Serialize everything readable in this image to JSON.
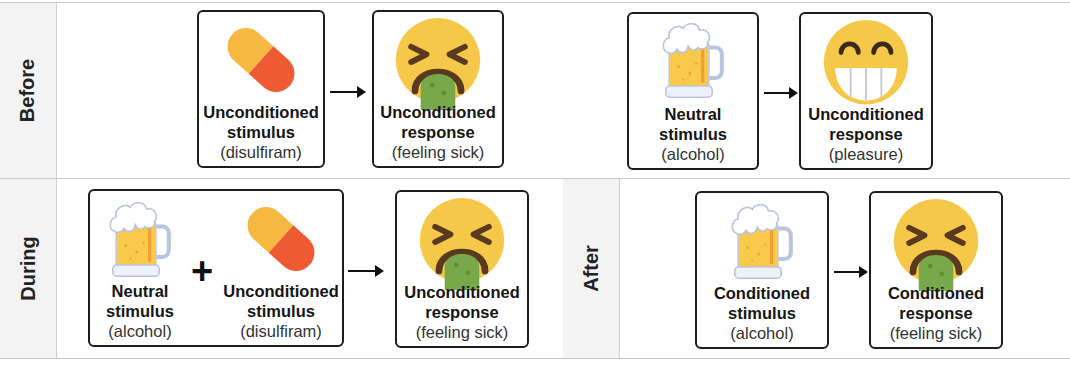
{
  "rows": {
    "before": {
      "label": "Before"
    },
    "during": {
      "label": "During"
    },
    "after": {
      "label": "After"
    }
  },
  "before_left": {
    "stimulus": {
      "icon": "pill-icon",
      "line1": "Unconditioned",
      "line2": "stimulus",
      "line3": "(disulfiram)"
    },
    "response": {
      "icon": "vomiting-face-icon",
      "line1": "Unconditioned",
      "line2": "response",
      "line3": "(feeling sick)"
    }
  },
  "before_right": {
    "stimulus": {
      "icon": "beer-mug-icon",
      "line1": "Neutral",
      "line2": "stimulus",
      "line3": "(alcohol)"
    },
    "response": {
      "icon": "grinning-face-icon",
      "line1": "Unconditioned",
      "line2": "response",
      "line3": "(pleasure)"
    }
  },
  "during": {
    "stimulus_a": {
      "icon": "beer-mug-icon",
      "line1": "Neutral",
      "line2": "stimulus",
      "line3": "(alcohol)"
    },
    "plus": "+",
    "stimulus_b": {
      "icon": "pill-icon",
      "line1": "Unconditioned",
      "line2": "stimulus",
      "line3": "(disulfiram)"
    },
    "response": {
      "icon": "vomiting-face-icon",
      "line1": "Unconditioned",
      "line2": "response",
      "line3": "(feeling sick)"
    }
  },
  "after": {
    "stimulus": {
      "icon": "beer-mug-icon",
      "line1": "Conditioned",
      "line2": "stimulus",
      "line3": "(alcohol)"
    },
    "response": {
      "icon": "vomiting-face-icon",
      "line1": "Conditioned",
      "line2": "response",
      "line3": "(feeling sick)"
    }
  },
  "colors": {
    "face_yellow": "#f6c84a",
    "vomit_green": "#77a84a",
    "pill_yellow": "#f5b942",
    "pill_red": "#ee5a32",
    "beer_amber": "#f8c94a",
    "outline": "#1c1c1c"
  }
}
